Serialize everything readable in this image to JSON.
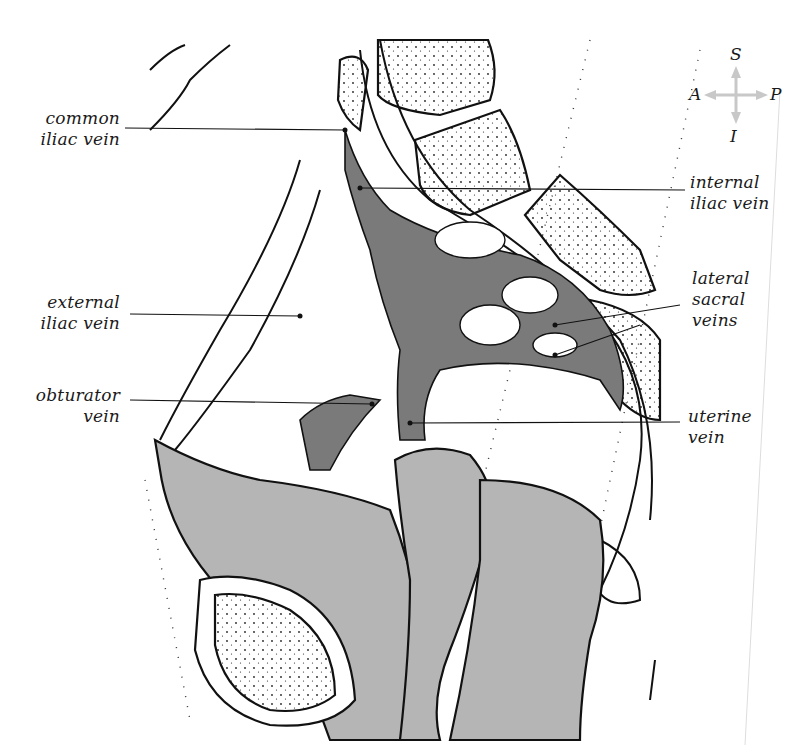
{
  "figure": {
    "type": "anatomical sagittal section diagram",
    "colors": {
      "vein_fill": "#7a7a7a",
      "tissue_fill": "#b5b5b5",
      "outline": "#111111",
      "background": "#ffffff",
      "compass_arrows": "#c8c8c8"
    }
  },
  "compass": {
    "superior": "S",
    "inferior": "I",
    "anterior": "A",
    "posterior": "P"
  },
  "labels": {
    "common_iliac_vein": {
      "line1": "common",
      "line2": "iliac vein"
    },
    "external_iliac_vein": {
      "line1": "external",
      "line2": "iliac vein"
    },
    "obturator_vein": {
      "line1": "obturator",
      "line2": "vein"
    },
    "internal_iliac_vein": {
      "line1": "internal",
      "line2": "iliac vein"
    },
    "lateral_sacral_veins": {
      "line1": "lateral",
      "line2": "sacral",
      "line3": "veins"
    },
    "uterine_vein": {
      "line1": "uterine",
      "line2": "vein"
    }
  }
}
